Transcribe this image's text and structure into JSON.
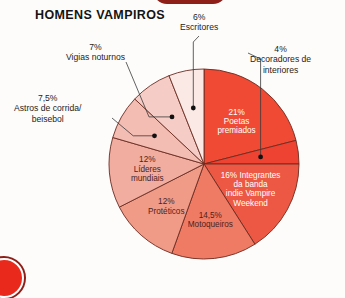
{
  "title": "HOMENS VAMPIROS",
  "background_color": "#fdfcfb",
  "decor": {
    "top_arc_color": "#8e1f18",
    "bottom_circle_color": "#e8291c"
  },
  "callouts": [
    {
      "id": "escritores",
      "pct": "6%",
      "name": "Escritores"
    },
    {
      "id": "decoradores",
      "pct": "4%",
      "name": "Decoradores de interiores"
    },
    {
      "id": "vigias",
      "pct": "7%",
      "name": "Vigias noturnos"
    },
    {
      "id": "astros",
      "pct": "7,5%",
      "name": "Astros de corrida/ beisebol"
    }
  ],
  "chart_data": {
    "type": "pie",
    "title": "HOMENS VAMPIROS",
    "xlabel": "",
    "ylabel": "",
    "units": "percent",
    "total": 100,
    "start_angle_deg": 0,
    "direction": "clockwise",
    "legend": "none (labels on slices and callouts)",
    "slices": [
      {
        "label": "Poetas premiados",
        "value": 21,
        "value_text": "21%",
        "color": "#f04a34",
        "label_placement": "inside",
        "label_color": "#ffffff",
        "label_lines": [
          "21%",
          "Poetas",
          "premiados"
        ]
      },
      {
        "label": "Decoradores de interiores",
        "value": 4,
        "value_text": "4%",
        "color": "#ee4332",
        "label_placement": "callout",
        "label_color": "#1c1c1c",
        "label_lines": [
          "4%",
          "Decoradores de",
          "interiores"
        ]
      },
      {
        "label": "Integrantes da banda indie Vampire Weekend",
        "value": 16,
        "value_text": "16%",
        "color": "#ec5843",
        "label_placement": "inside",
        "label_color": "#ffffff",
        "label_lines": [
          "16% Integrantes",
          "da banda",
          "indie Vampire",
          "Weekend"
        ]
      },
      {
        "label": "Motoqueiros",
        "value": 14.5,
        "value_text": "14,5%",
        "color": "#ef7b65",
        "label_placement": "inside",
        "label_color": "#4a241d",
        "label_lines": [
          "14,5%",
          "Motoqueiros"
        ]
      },
      {
        "label": "Protéticos",
        "value": 12,
        "value_text": "12%",
        "color": "#f09b88",
        "label_placement": "inside",
        "label_color": "#4a241d",
        "label_lines": [
          "12%",
          "Protéticos"
        ]
      },
      {
        "label": "Líderes mundiais",
        "value": 12,
        "value_text": "12%",
        "color": "#f0ada0",
        "label_placement": "inside",
        "label_color": "#4a241d",
        "label_lines": [
          "12%",
          "Líderes",
          "mundiais"
        ]
      },
      {
        "label": "Astros de corrida/ beisebol",
        "value": 7.5,
        "value_text": "7,5%",
        "color": "#f3bdb3",
        "label_placement": "callout",
        "label_color": "#1c1c1c",
        "label_lines": [
          "7,5%",
          "Astros de corrida/",
          "beisebol"
        ]
      },
      {
        "label": "Vigias noturnos",
        "value": 7,
        "value_text": "7%",
        "color": "#f6cdc6",
        "label_placement": "callout",
        "label_color": "#1c1c1c",
        "label_lines": [
          "7%",
          "Vigias noturnos"
        ]
      },
      {
        "label": "Escritores",
        "value": 6,
        "value_text": "6%",
        "color": "#fbe9e5",
        "label_placement": "callout",
        "label_color": "#1c1c1c",
        "label_lines": [
          "6%",
          "Escritores"
        ]
      }
    ]
  }
}
